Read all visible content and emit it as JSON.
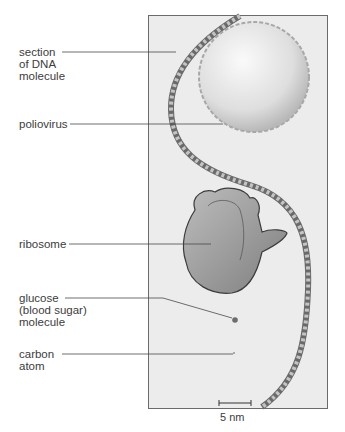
{
  "labels": {
    "dna": [
      "section",
      "of DNA",
      "molecule"
    ],
    "poliovirus": "poliovirus",
    "ribosome": "ribosome",
    "glucose": [
      "glucose",
      "(blood sugar)",
      "molecule"
    ],
    "carbon": [
      "carbon",
      "atom"
    ]
  },
  "scale_bar": {
    "label": "5 nm"
  },
  "colors": {
    "panel_bg": "#ececec",
    "virus": "#dcdcdc",
    "ribosome": "#9a9a9a",
    "dna_dark": "#555555",
    "dna_light": "#bdbdbd"
  }
}
